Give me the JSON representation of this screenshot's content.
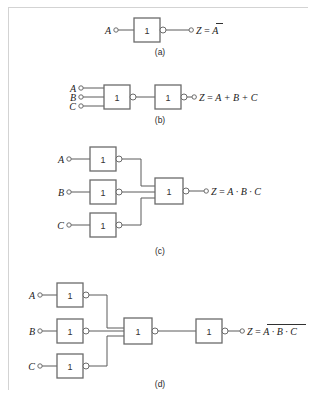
{
  "figure": {
    "name": "logic-gate-circuits-de-morgan",
    "background_color": "#ffffff",
    "wire_color": "#5a5a5a",
    "gate_outline_color": "#6b6b6b",
    "text_color": "#1a1a1a",
    "gate_symbol": "1",
    "gate_type": "inverter-iec-rectangular"
  },
  "circuits": [
    {
      "id": "a",
      "caption": "(a)",
      "inputs": [
        "A"
      ],
      "gate_count": 1,
      "gate_labels": [
        "1"
      ],
      "output_label": "Z",
      "output_equals": "=",
      "output_expression": "A",
      "output_expression_full": "Z = Ā",
      "output_overbar": true,
      "output_overbar_terms": "A"
    },
    {
      "id": "b",
      "caption": "(b)",
      "inputs": [
        "A",
        "B",
        "C"
      ],
      "gate_count": 2,
      "gate_labels": [
        "1",
        "1"
      ],
      "output_label": "Z",
      "output_equals": "=",
      "output_expression": "A + B + C",
      "output_expression_full": "Z = A + B + C",
      "output_overbar": false
    },
    {
      "id": "c",
      "caption": "(c)",
      "inputs": [
        "A",
        "B",
        "C"
      ],
      "gate_count": 4,
      "gate_labels": [
        "1",
        "1",
        "1",
        "1"
      ],
      "output_label": "Z",
      "output_equals": "=",
      "output_expression": "A · B · C",
      "output_expression_full": "Z = A · B · C",
      "output_overbar": false
    },
    {
      "id": "d",
      "caption": "(d)",
      "inputs": [
        "A",
        "B",
        "C"
      ],
      "gate_count": 5,
      "gate_labels": [
        "1",
        "1",
        "1",
        "1",
        "1"
      ],
      "output_label": "Z",
      "output_equals": "=",
      "output_expression": "A · B · C",
      "output_expression_full": "Z = ̅A̅ ̅·̅ ̅B̅ ̅·̅ ̅C̅",
      "output_overbar": true,
      "output_overbar_terms": "A · B · C"
    }
  ]
}
